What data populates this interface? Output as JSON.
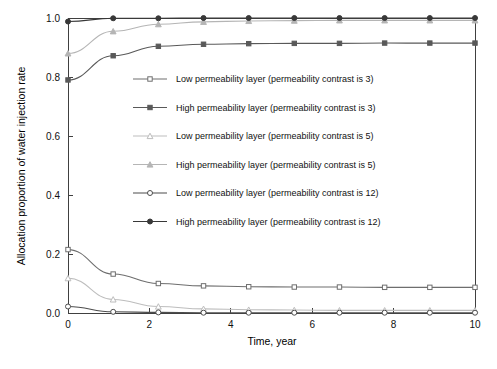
{
  "chart_data": {
    "type": "line",
    "title": "",
    "xlabel": "Time, year",
    "ylabel": "Allocation proportion of water injection rate",
    "xlim": [
      0,
      10
    ],
    "ylim": [
      0,
      1.0
    ],
    "xticks": [
      0,
      2,
      4,
      6,
      8,
      10
    ],
    "xtick_labels": [
      "0",
      "2",
      "4",
      "6",
      "8",
      "10"
    ],
    "yticks": [
      0.0,
      0.2,
      0.4,
      0.6,
      0.8,
      1.0
    ],
    "ytick_labels": [
      "0.0",
      "0.2",
      "0.4",
      "0.6",
      "0.8",
      "1.0"
    ],
    "grid": false,
    "legend_position": "inside-upper-center",
    "x": [
      0,
      1.11,
      2.22,
      3.33,
      4.44,
      5.56,
      6.67,
      7.78,
      8.89,
      10
    ],
    "series": [
      {
        "name": "Low permeability layer (permeability contrast is 3)",
        "marker": "open-square",
        "color": "#6e6e6e",
        "values": [
          0.215,
          0.132,
          0.1,
          0.092,
          0.089,
          0.088,
          0.088,
          0.087,
          0.087,
          0.087
        ]
      },
      {
        "name": "High permeability layer (permeability contrast is 3)",
        "marker": "filled-square",
        "color": "#595959",
        "values": [
          0.79,
          0.872,
          0.904,
          0.911,
          0.913,
          0.914,
          0.914,
          0.915,
          0.915,
          0.915
        ]
      },
      {
        "name": "Low permeability layer (permeability contrast is 5)",
        "marker": "open-triangle",
        "color": "#bdbdbd",
        "values": [
          0.118,
          0.046,
          0.022,
          0.014,
          0.011,
          0.01,
          0.009,
          0.009,
          0.009,
          0.009
        ]
      },
      {
        "name": "High permeability layer (permeability contrast is 5)",
        "marker": "filled-triangle",
        "color": "#b5b5b5",
        "values": [
          0.88,
          0.955,
          0.979,
          0.987,
          0.99,
          0.991,
          0.992,
          0.992,
          0.992,
          0.992
        ]
      },
      {
        "name": "Low permeability layer (permeability contrast is 12)",
        "marker": "open-circle",
        "color": "#4d4d4d",
        "values": [
          0.022,
          0.004,
          0.002,
          0.001,
          0.001,
          0.001,
          0.001,
          0.001,
          0.001,
          0.001
        ]
      },
      {
        "name": "High permeability layer (permeability contrast is 12)",
        "marker": "filled-circle",
        "color": "#383838",
        "values": [
          0.988,
          0.999,
          0.999,
          1.0,
          1.0,
          1.0,
          1.0,
          1.0,
          1.0,
          1.0
        ]
      }
    ]
  },
  "legend": {
    "items": [
      {
        "label": "Low permeability layer (permeability contrast is 3)"
      },
      {
        "label": "High permeability layer (permeability contrast is 3)"
      },
      {
        "label": "Low permeability layer (permeability contrast is 5)"
      },
      {
        "label": "High permeability layer (permeability contrast is 5)"
      },
      {
        "label": "Low permeability layer (permeability contrast is 12)"
      },
      {
        "label": "High permeability layer (permeability contrast is 12)"
      }
    ]
  },
  "caption": {
    "text": "cut-off caption line"
  }
}
